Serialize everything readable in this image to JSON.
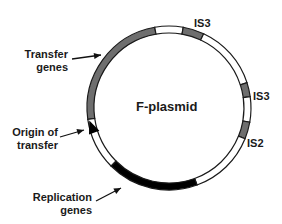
{
  "diagram": {
    "title": "F-plasmid",
    "colors": {
      "background": "#ffffff",
      "outline": "#1a1a1a",
      "transfer": "#6e6e6e",
      "insertion": "#6e6e6e",
      "replication": "#000000",
      "blank": "#ffffff"
    },
    "ring": {
      "cx": 169,
      "cy": 108,
      "r_outer": 82,
      "r_inner": 75
    },
    "segments": [
      {
        "name": "transfer-genes-segment",
        "from": 262,
        "to": 350,
        "fill": "transfer"
      },
      {
        "name": "is3-top-segment",
        "from": 350,
        "to": 370,
        "fill": "blank"
      },
      {
        "name": "transfer-genes-segment-2",
        "from": 370,
        "to": 385,
        "fill": "transfer"
      },
      {
        "name": "blank-segment-1",
        "from": 385,
        "to": 432,
        "fill": "blank"
      },
      {
        "name": "is3-right-segment",
        "from": 432,
        "to": 442,
        "fill": "insertion"
      },
      {
        "name": "blank-segment-2",
        "from": 442,
        "to": 460,
        "fill": "blank"
      },
      {
        "name": "is2-segment",
        "from": 460,
        "to": 472,
        "fill": "insertion"
      },
      {
        "name": "blank-segment-3",
        "from": 472,
        "to": 520,
        "fill": "blank"
      },
      {
        "name": "replication-genes-segment",
        "from": 520,
        "to": 585,
        "fill": "replication"
      },
      {
        "name": "blank-segment-4",
        "from": 585,
        "to": 622,
        "fill": "blank"
      }
    ],
    "origin_arrow": {
      "x": 92,
      "y": 128,
      "angle": -20
    },
    "labels": {
      "is3_top": "IS3",
      "is3_right": "IS3",
      "is2": "IS2",
      "transfer_line1": "Transfer",
      "transfer_line2": "genes",
      "origin_line1": "Origin of",
      "origin_line2": "transfer",
      "replication_line1": "Replication",
      "replication_line2": "genes"
    },
    "pointers": [
      {
        "name": "transfer-genes-pointer",
        "x1": 72,
        "y1": 59,
        "x2": 101,
        "y2": 55
      },
      {
        "name": "origin-pointer",
        "x1": 60,
        "y1": 137,
        "x2": 84,
        "y2": 130
      },
      {
        "name": "replication-pointer",
        "x1": 96,
        "y1": 201,
        "x2": 121,
        "y2": 188
      }
    ]
  }
}
